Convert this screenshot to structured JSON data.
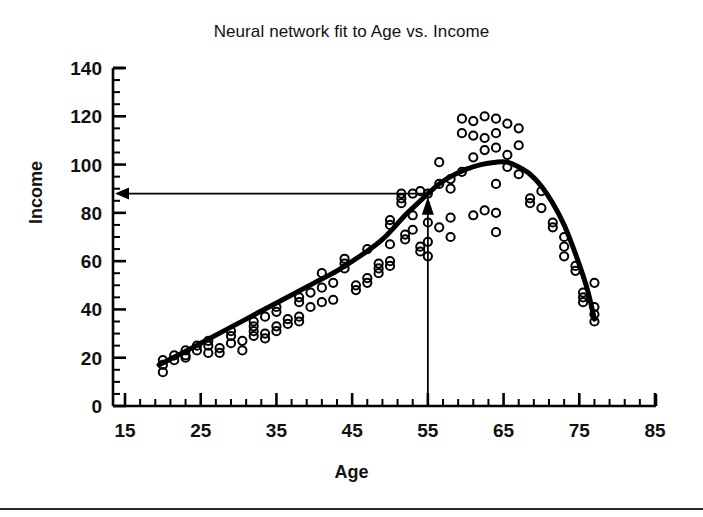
{
  "figure": {
    "title": "Neural network fit to Age vs. Income",
    "background_color": "#ffffff",
    "ink_color": "#000000",
    "footer_rule": true
  },
  "axes": {
    "x_label": "Age",
    "y_label": "Income",
    "x_ticks": [
      "15",
      "25",
      "35",
      "45",
      "55",
      "65",
      "75",
      "85"
    ],
    "y_ticks": [
      "0",
      "20",
      "40",
      "60",
      "80",
      "100",
      "120",
      "140"
    ]
  },
  "annotations": {
    "vertical_arrow_label": "age-55-marker",
    "horizontal_arrow_label": "income-88-readout",
    "marker_x": 55,
    "marker_y": 88
  },
  "chart_data": {
    "type": "scatter",
    "title": "Neural network fit to Age vs. Income",
    "xlabel": "Age",
    "ylabel": "Income",
    "xlim": [
      15,
      85
    ],
    "ylim": [
      0,
      140
    ],
    "x_ticks": [
      15,
      25,
      35,
      45,
      55,
      65,
      75,
      85
    ],
    "y_ticks": [
      0,
      20,
      40,
      60,
      80,
      100,
      120,
      140
    ],
    "x_minor_tick_step": 2,
    "y_minor_tick_step": 5,
    "grid": false,
    "legend": false,
    "marker_style": "open-circle",
    "series": [
      {
        "name": "Observations",
        "type": "scatter",
        "points": [
          [
            20,
            19
          ],
          [
            20,
            17
          ],
          [
            20,
            14
          ],
          [
            21.5,
            21
          ],
          [
            21.5,
            19
          ],
          [
            23,
            23
          ],
          [
            23,
            21
          ],
          [
            23,
            20
          ],
          [
            24.5,
            25
          ],
          [
            24.5,
            23
          ],
          [
            26,
            27
          ],
          [
            26,
            25
          ],
          [
            26,
            22
          ],
          [
            27.5,
            24
          ],
          [
            27.5,
            22
          ],
          [
            29,
            31
          ],
          [
            29,
            29
          ],
          [
            29,
            26
          ],
          [
            30.5,
            27
          ],
          [
            30.5,
            23
          ],
          [
            32,
            35
          ],
          [
            32,
            33
          ],
          [
            32,
            31
          ],
          [
            32,
            29
          ],
          [
            33.5,
            37
          ],
          [
            33.5,
            30
          ],
          [
            33.5,
            28
          ],
          [
            35,
            41
          ],
          [
            35,
            39
          ],
          [
            35,
            33
          ],
          [
            35,
            31
          ],
          [
            36.5,
            36
          ],
          [
            36.5,
            34
          ],
          [
            38,
            45
          ],
          [
            38,
            43
          ],
          [
            38,
            37
          ],
          [
            38,
            35
          ],
          [
            39.5,
            47
          ],
          [
            39.5,
            41
          ],
          [
            41,
            55
          ],
          [
            41,
            49
          ],
          [
            41,
            43
          ],
          [
            42.5,
            51
          ],
          [
            42.5,
            44
          ],
          [
            44,
            61
          ],
          [
            44,
            59
          ],
          [
            44,
            57
          ],
          [
            45.5,
            50
          ],
          [
            45.5,
            48
          ],
          [
            47,
            65
          ],
          [
            47,
            53
          ],
          [
            47,
            51
          ],
          [
            48.5,
            59
          ],
          [
            48.5,
            57
          ],
          [
            48.5,
            55
          ],
          [
            50,
            77
          ],
          [
            50,
            75
          ],
          [
            50,
            67
          ],
          [
            50,
            60
          ],
          [
            50,
            58
          ],
          [
            51.5,
            88
          ],
          [
            51.5,
            86
          ],
          [
            51.5,
            84
          ],
          [
            52,
            71
          ],
          [
            52,
            69
          ],
          [
            53,
            88
          ],
          [
            53,
            79
          ],
          [
            53,
            73
          ],
          [
            54,
            89
          ],
          [
            54,
            66
          ],
          [
            54,
            64
          ],
          [
            55,
            88
          ],
          [
            55,
            76
          ],
          [
            55,
            68
          ],
          [
            55,
            62
          ],
          [
            56.5,
            101
          ],
          [
            56.5,
            92
          ],
          [
            56.5,
            74
          ],
          [
            58,
            94
          ],
          [
            58,
            90
          ],
          [
            58,
            78
          ],
          [
            58,
            70
          ],
          [
            59.5,
            119
          ],
          [
            59.5,
            113
          ],
          [
            59.5,
            97
          ],
          [
            61,
            118
          ],
          [
            61,
            112
          ],
          [
            61,
            103
          ],
          [
            61,
            79
          ],
          [
            62.5,
            120
          ],
          [
            62.5,
            111
          ],
          [
            62.5,
            106
          ],
          [
            62.5,
            81
          ],
          [
            64,
            119
          ],
          [
            64,
            113
          ],
          [
            64,
            107
          ],
          [
            64,
            92
          ],
          [
            64,
            80
          ],
          [
            64,
            72
          ],
          [
            65.5,
            117
          ],
          [
            65.5,
            104
          ],
          [
            65.5,
            99
          ],
          [
            67,
            115
          ],
          [
            67,
            108
          ],
          [
            67,
            96
          ],
          [
            68.5,
            86
          ],
          [
            68.5,
            84
          ],
          [
            70,
            89
          ],
          [
            70,
            82
          ],
          [
            71.5,
            76
          ],
          [
            71.5,
            74
          ],
          [
            73,
            70
          ],
          [
            73,
            66
          ],
          [
            73,
            62
          ],
          [
            74.5,
            58
          ],
          [
            74.5,
            56
          ],
          [
            75.5,
            47
          ],
          [
            75.5,
            45
          ],
          [
            75.5,
            43
          ],
          [
            77,
            51
          ],
          [
            77,
            41
          ],
          [
            77,
            38
          ],
          [
            77,
            35
          ]
        ]
      },
      {
        "name": "Neural network fit",
        "type": "line",
        "line_width": 5,
        "points": [
          [
            19.5,
            17
          ],
          [
            22,
            21
          ],
          [
            25,
            26
          ],
          [
            28,
            31
          ],
          [
            31,
            36
          ],
          [
            34,
            41
          ],
          [
            37,
            46
          ],
          [
            40,
            51
          ],
          [
            43,
            56
          ],
          [
            46,
            62
          ],
          [
            49,
            69
          ],
          [
            52,
            79
          ],
          [
            54,
            85
          ],
          [
            55,
            88
          ],
          [
            56.5,
            92
          ],
          [
            58,
            95
          ],
          [
            60,
            98
          ],
          [
            62,
            100
          ],
          [
            64,
            101
          ],
          [
            65.5,
            101
          ],
          [
            67,
            99
          ],
          [
            68.5,
            96
          ],
          [
            70,
            91
          ],
          [
            71.5,
            84
          ],
          [
            73,
            75
          ],
          [
            74.5,
            63
          ],
          [
            76,
            49
          ],
          [
            77,
            36
          ]
        ]
      }
    ],
    "annotations": [
      {
        "type": "arrow",
        "label": "age-55-marker",
        "direction": "up",
        "from": [
          55,
          0
        ],
        "to": [
          55,
          85
        ]
      },
      {
        "type": "arrow",
        "label": "income-88-readout",
        "direction": "left",
        "from": [
          55,
          88
        ],
        "to": [
          15,
          88
        ]
      }
    ]
  }
}
